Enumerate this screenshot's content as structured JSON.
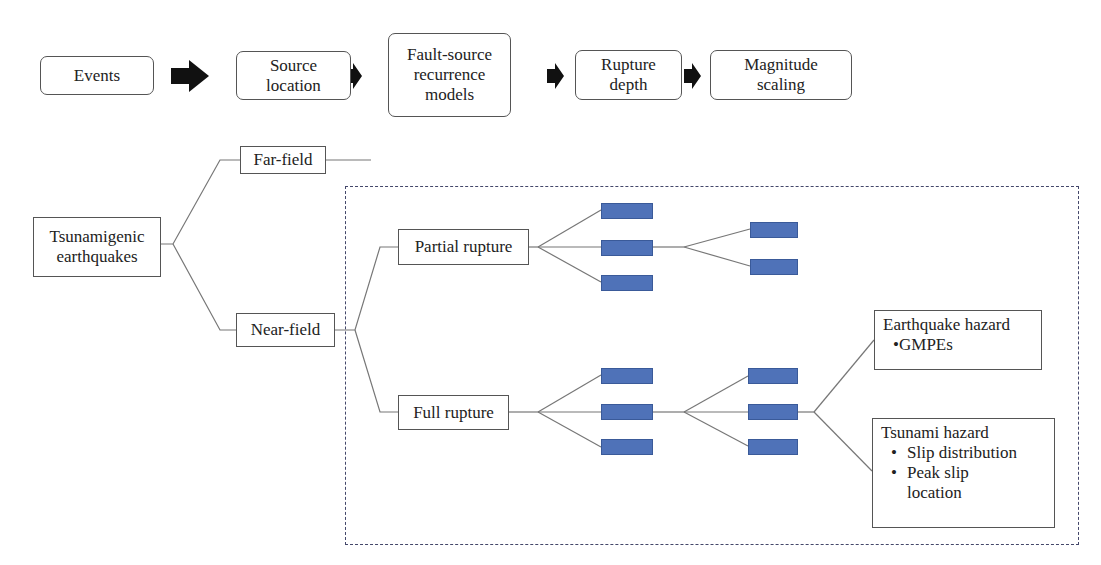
{
  "pipeline": {
    "steps": [
      {
        "label": "Events"
      },
      {
        "label": "Source\nlocation"
      },
      {
        "label": "Fault-source\nrecurrence\nmodels"
      },
      {
        "label": "Rupture\ndepth"
      },
      {
        "label": "Magnitude\nscaling"
      }
    ],
    "arrow_icon": "right-arrow-icon"
  },
  "tree": {
    "root": {
      "label": "Tsunamigenic\nearthquakes"
    },
    "far_field": {
      "label": "Far-field"
    },
    "near_field": {
      "label": "Near-field"
    },
    "partial_rupture": {
      "label": "Partial rupture"
    },
    "full_rupture": {
      "label": "Full rupture"
    },
    "earthquake_hazard": {
      "title": "Earthquake hazard",
      "items": [
        "GMPEs"
      ]
    },
    "tsunami_hazard": {
      "title": "Tsunami hazard",
      "items": [
        "Slip distribution",
        "Peak slip\nlocation"
      ]
    }
  },
  "colors": {
    "leaf_fill": "#4f72b8",
    "dashed_border": "#44476a",
    "line": "#777777"
  }
}
